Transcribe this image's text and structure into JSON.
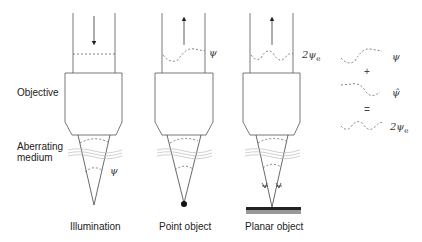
{
  "labels": {
    "objective": "Objective",
    "aberrating_medium_line1": "Aberrating",
    "aberrating_medium_line2": "medium",
    "illumination": "Illumination",
    "point_object": "Point object",
    "planar_object": "Planar object"
  },
  "symbols": {
    "psi": "ψ",
    "psi_hat": "ψ̂",
    "two_psi_e_main": "2ψ",
    "e_sub": "e",
    "plus": "+",
    "equals": "="
  },
  "panels": [
    {
      "name": "illumination",
      "arrow": "down",
      "wavefront_in_tube": "flat"
    },
    {
      "name": "point-object",
      "arrow": "up",
      "wavefront_in_tube": "psi"
    },
    {
      "name": "planar-object",
      "arrow": "up",
      "wavefront_in_tube": "2psi_e"
    }
  ],
  "colors": {
    "line": "#555555",
    "dashed": "#666666",
    "medium": "#bbbbbb",
    "plate_top": "#222222",
    "plate_bottom": "#999999",
    "point": "#111111"
  }
}
